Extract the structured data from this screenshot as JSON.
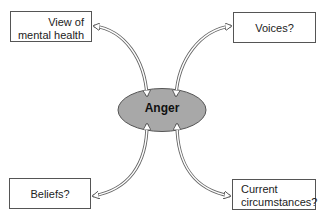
{
  "diagram": {
    "center": {
      "label": "Anger",
      "fill": "#a8a8a8"
    },
    "nodes": [
      {
        "id": "top-left",
        "line1": "View of",
        "line2": "mental health"
      },
      {
        "id": "top-right",
        "label": "Voices?"
      },
      {
        "id": "bottom-left",
        "label": "Beliefs?"
      },
      {
        "id": "bottom-right",
        "line1": "Current",
        "line2": "circumstances?"
      }
    ],
    "connectors": "double-headed hollow curved arrows from each box to the center ellipse"
  }
}
